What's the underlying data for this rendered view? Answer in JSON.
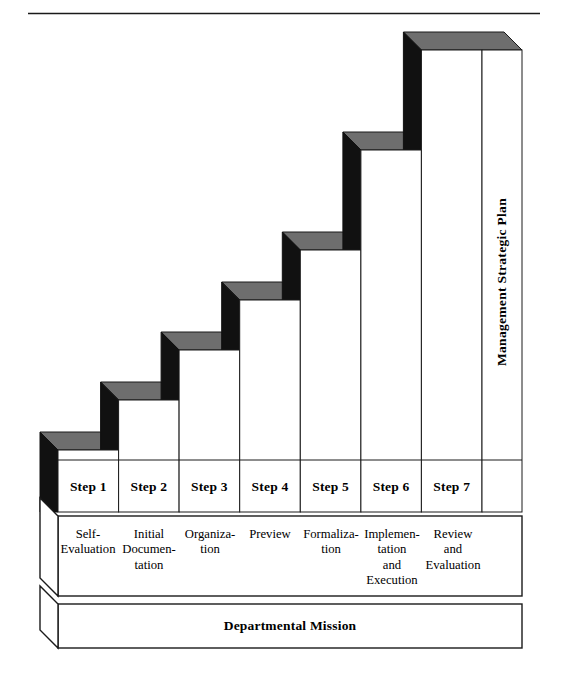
{
  "diagram": {
    "title_rule": true,
    "vertical_axis_label": "Management Strategic Plan",
    "foundation_label": "Departmental Mission",
    "colors": {
      "riser_face": "#111111",
      "top_face": "#6e6e6e",
      "front_face": "#ffffff",
      "outline": "#1a1a1a",
      "background": "#ffffff"
    },
    "steps": [
      {
        "number": 1,
        "step_label": "Step 1",
        "description_lines": [
          "Self-",
          "Evaluation"
        ]
      },
      {
        "number": 2,
        "step_label": "Step 2",
        "description_lines": [
          "Initial",
          "Documen-",
          "tation"
        ]
      },
      {
        "number": 3,
        "step_label": "Step 3",
        "description_lines": [
          "Organiza-",
          "tion"
        ]
      },
      {
        "number": 4,
        "step_label": "Step 4",
        "description_lines": [
          "Preview"
        ]
      },
      {
        "number": 5,
        "step_label": "Step 5",
        "description_lines": [
          "Formaliza-",
          "tion"
        ]
      },
      {
        "number": 6,
        "step_label": "Step 6",
        "description_lines": [
          "Implemen-",
          "tation",
          "and",
          "Execution"
        ]
      },
      {
        "number": 7,
        "step_label": "Step 7",
        "description_lines": [
          "Review",
          "and",
          "Evaluation"
        ]
      }
    ]
  },
  "chart_data": {
    "type": "bar",
    "title": "",
    "subtitle": "",
    "xlabel": "",
    "ylabel": "Management Strategic Plan",
    "categories": [
      "Step 1",
      "Step 2",
      "Step 3",
      "Step 4",
      "Step 5",
      "Step 6",
      "Step 7"
    ],
    "values": [
      1,
      2,
      3,
      4,
      5,
      6,
      7
    ],
    "ylim": [
      0,
      7
    ],
    "grid": false,
    "legend": "none",
    "annotations": [
      "Self-Evaluation",
      "Initial Documentation",
      "Organization",
      "Preview",
      "Formalization",
      "Implementation and Execution",
      "Review and Evaluation",
      "Departmental Mission"
    ]
  }
}
